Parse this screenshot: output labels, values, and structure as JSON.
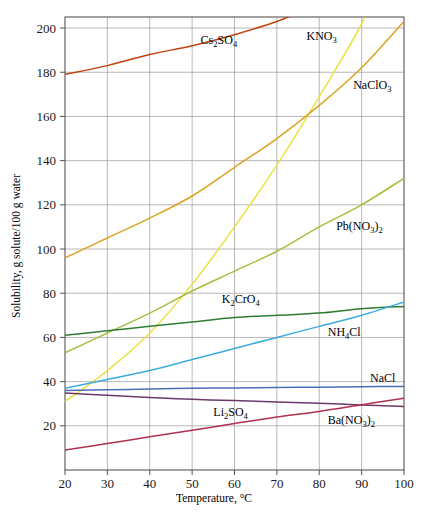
{
  "chart_data": {
    "type": "line",
    "title": "",
    "xlabel": "Temperature, °C",
    "ylabel": "Solubility, g solute/100 g water",
    "xlim": [
      20,
      100
    ],
    "ylim": [
      0,
      205
    ],
    "xticks": [
      20,
      30,
      40,
      50,
      60,
      70,
      80,
      90,
      100
    ],
    "yticks": [
      20,
      40,
      60,
      80,
      100,
      120,
      140,
      160,
      180,
      200
    ],
    "grid": true,
    "legend_position": "inline-labels",
    "x": [
      20,
      30,
      40,
      50,
      60,
      70,
      80,
      90,
      100
    ],
    "series": [
      {
        "name": "Cs2SO4",
        "label_html": "Cs<sub>2</sub>SO<sub>4</sub>",
        "color": "#c2410c",
        "values": [
          179,
          183,
          188,
          192,
          197,
          203,
          null,
          null,
          null
        ],
        "label_x": 52,
        "label_y": 194
      },
      {
        "name": "KNO3",
        "label_html": "KNO<sub>3</sub>",
        "color": "#edE040",
        "values": [
          31,
          45,
          62,
          84,
          110,
          138,
          169,
          202,
          null
        ],
        "label_x": 77,
        "label_y": 196
      },
      {
        "name": "NaClO3",
        "label_html": "NaClO<sub>3</sub>",
        "color": "#d9a520",
        "values": [
          96,
          105,
          114,
          124,
          137,
          150,
          165,
          182,
          203
        ],
        "label_x": 88,
        "label_y": 174
      },
      {
        "name": "Pb(NO3)2",
        "label_html": "Pb(NO<sub>3</sub>)<sub>2</sub>",
        "color": "#a3bf3c",
        "values": [
          53,
          62,
          71,
          81,
          90,
          99,
          110,
          120,
          132
        ],
        "label_x": 84,
        "label_y": 110
      },
      {
        "name": "K2CrO4",
        "label_html": "K<sub>2</sub>CrO<sub>4</sub>",
        "color": "#2f7d32",
        "values": [
          61,
          63,
          65,
          67,
          69,
          70,
          71,
          73,
          74
        ],
        "label_x": 57,
        "label_y": 77
      },
      {
        "name": "NH4Cl",
        "label_html": "NH<sub>4</sub>Cl",
        "color": "#3cabe0",
        "values": [
          37,
          41,
          45,
          50,
          55,
          60,
          65,
          70,
          76
        ],
        "label_x": 82,
        "label_y": 62
      },
      {
        "name": "NaCl",
        "label_html": "NaCl",
        "color": "#4a6fb5",
        "values": [
          36,
          36.3,
          36.6,
          37,
          37.1,
          37.3,
          37.5,
          37.7,
          37.8
        ],
        "label_x": 92,
        "label_y": 41
      },
      {
        "name": "Li2SO4",
        "label_html": "Li<sub>2</sub>SO<sub>4</sub>",
        "color": "#6b3a6b",
        "values": [
          34.8,
          33.8,
          32.8,
          32,
          31.4,
          30.8,
          30.2,
          29.4,
          28.7
        ],
        "label_x": 55,
        "label_y": 26
      },
      {
        "name": "Ba(NO3)2",
        "label_html": "Ba(NO<sub>3</sub>)<sub>2</sub>",
        "color": "#b03050",
        "values": [
          9,
          12,
          15,
          18,
          21,
          24,
          26.5,
          29.5,
          32.5
        ],
        "label_x": 82,
        "label_y": 22
      }
    ]
  },
  "axes": {
    "x_tick_labels": [
      "20",
      "30",
      "40",
      "50",
      "60",
      "70",
      "80",
      "90",
      "100"
    ],
    "y_tick_labels": [
      "20",
      "40",
      "60",
      "80",
      "100",
      "120",
      "140",
      "160",
      "180",
      "200"
    ],
    "x_axis_title": "Temperature, °C",
    "y_axis_title": "Solubility, g solute/100 g water"
  },
  "style": {
    "grid_color": "#9a9a9a",
    "frame_color": "#555555",
    "background": "#ffffff",
    "text_color": "#1a1a1a"
  }
}
